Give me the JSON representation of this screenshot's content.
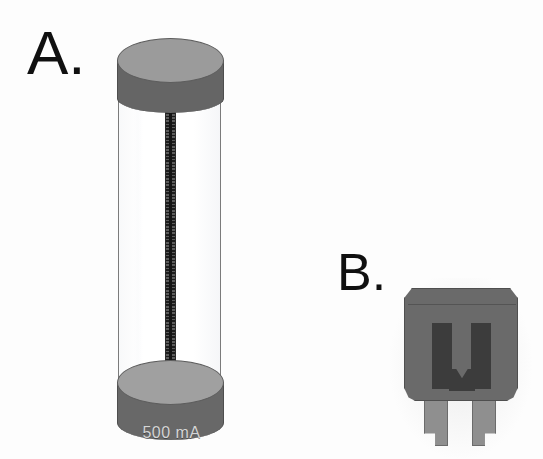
{
  "figure": {
    "background_color": "#fdfdfd"
  },
  "panels": [
    {
      "id": "a",
      "label": "A.",
      "subject": "glass-cartridge-fuse",
      "rating_text": "500 mA",
      "colors": {
        "end_cap_top_face": "#9b9b9b",
        "end_cap_band": "#656565",
        "glass_outline": "#7b7b7b",
        "filament_dark": "#1d1d1d",
        "filament_light": "#5c5c5c",
        "rating_text_color": "#d5d5d5"
      },
      "parts": [
        "top-end-cap",
        "glass-barrel",
        "coiled-filament",
        "bottom-end-cap",
        "rating-marking"
      ]
    },
    {
      "id": "b",
      "label": "B.",
      "subject": "blade-automotive-fuse",
      "colors": {
        "body": "#6a6a6a",
        "body_outline": "#4f4f4f",
        "internal_slot": "#3c3c3c",
        "blade_terminal": "#8f8f8f",
        "blade_outline": "#6b6b6b"
      },
      "parts": [
        "plastic-housing",
        "left-window-slot",
        "right-window-slot",
        "v-notch-element",
        "left-blade-terminal",
        "right-blade-terminal"
      ]
    }
  ]
}
